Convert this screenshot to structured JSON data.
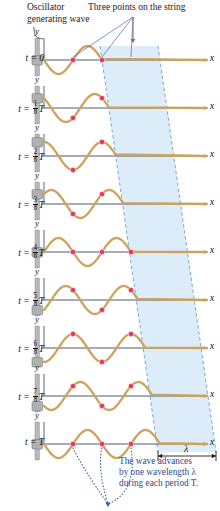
{
  "figure": {
    "title_oscillator": "Oscillator\ngenerating wave",
    "title_three_points": "Three points on the string",
    "advance_caption": "The wave advances\nby one wavelength λ\nduring each period T.",
    "lambda_symbol": "λ",
    "axis_x_label": "x",
    "axis_y_label": "y"
  },
  "colors": {
    "wave": "#cda35c",
    "wave_dark": "#b8873c",
    "axis": "#4a5a72",
    "point": "#e03a61",
    "band_fill": "#cfe4f5",
    "band_edge": "#6f9fd0",
    "rod": "#b9b9b9",
    "block": "#b0b0b0",
    "caption_blue": "#2b4a8b",
    "leader": "#5b7fb0"
  },
  "rows": [
    {
      "time_label": "t = 0",
      "t_frac": 0,
      "numerator": null,
      "denominator": null,
      "y": 60,
      "phase_shift": 0.0
    },
    {
      "time_label": "t = 1/8 T",
      "t_frac": 0.125,
      "numerator": "1",
      "denominator": "8",
      "y": 108,
      "phase_shift": 0.125
    },
    {
      "time_label": "t = 2/8 T",
      "t_frac": 0.25,
      "numerator": "2",
      "denominator": "8",
      "y": 156,
      "phase_shift": 0.25
    },
    {
      "time_label": "t = 3/8 T",
      "t_frac": 0.375,
      "numerator": "3",
      "denominator": "8",
      "y": 204,
      "phase_shift": 0.375
    },
    {
      "time_label": "t = 4/8 T",
      "t_frac": 0.5,
      "numerator": "4",
      "denominator": "8",
      "y": 252,
      "phase_shift": 0.5
    },
    {
      "time_label": "t = 5/8 T",
      "t_frac": 0.625,
      "numerator": "5",
      "denominator": "8",
      "y": 300,
      "phase_shift": 0.625
    },
    {
      "time_label": "t = 6/8 T",
      "t_frac": 0.75,
      "numerator": "6",
      "denominator": "8",
      "y": 348,
      "phase_shift": 0.75
    },
    {
      "time_label": "t = 7/8 T",
      "t_frac": 0.875,
      "numerator": "7",
      "denominator": "8",
      "y": 396,
      "phase_shift": 0.875
    },
    {
      "time_label": "t = T",
      "t_frac": 1.0,
      "numerator": null,
      "denominator": null,
      "y": 444,
      "phase_shift": 1.0
    }
  ],
  "chart_data": {
    "type": "line",
    "xlabel": "x",
    "ylabel": "y",
    "wavelength_px": 58,
    "amplitude_px": 14,
    "origin_x_px": 44,
    "axis_end_x_px": 207,
    "series_count": 9,
    "marked_points_count": 3,
    "marked_points_note": "Three points on the string move only vertically while the wave travels to the right."
  },
  "band": {
    "note": "Shaded parallelogram tracks one wavelength of the wave as it advances",
    "top_left_x": 100,
    "top_right_x": 158,
    "bottom_left_x": 158,
    "bottom_right_x": 216,
    "top_y": 46,
    "bottom_y": 452
  },
  "wavelength_bracket": {
    "label": "λ",
    "x_start": 158,
    "x_end": 216,
    "y": 456
  }
}
